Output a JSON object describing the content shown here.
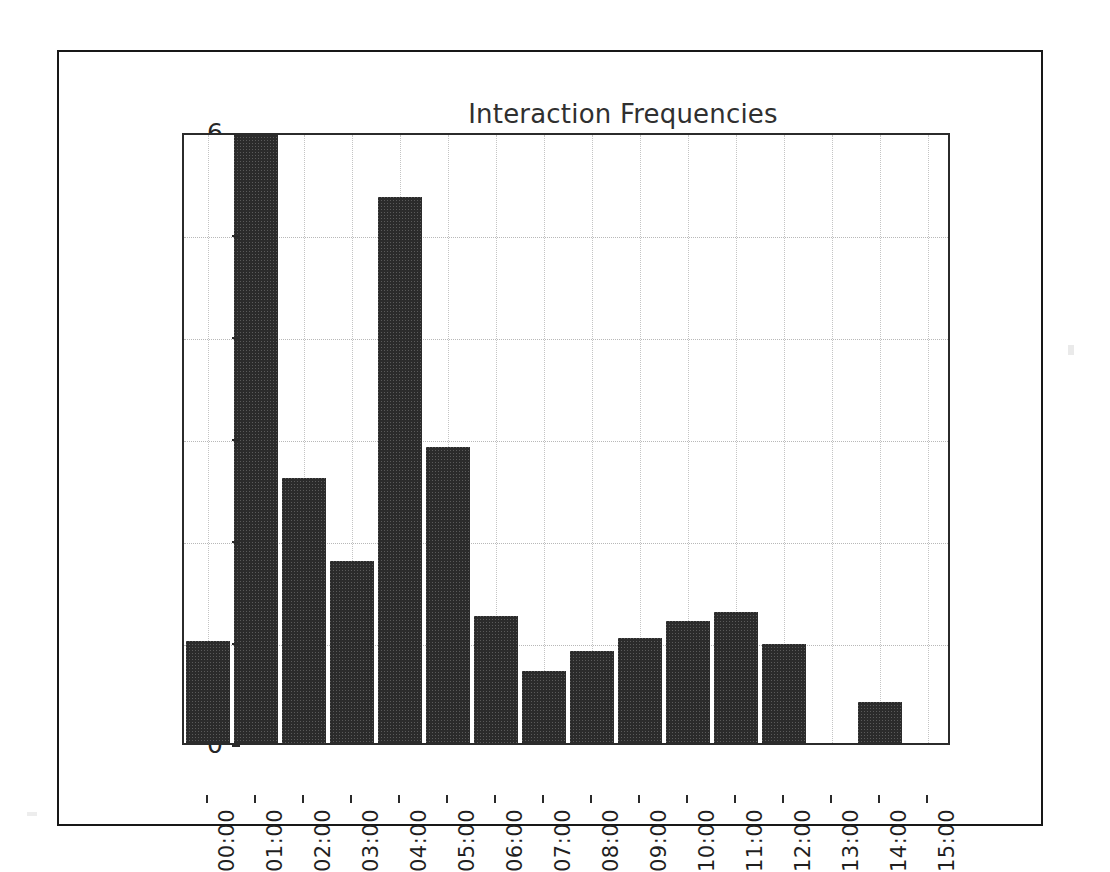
{
  "figure": {
    "background_color": "#ffffff",
    "border_color": "#181818",
    "bar_color": "#2b2b2b",
    "grid_color": "#bdbdbd",
    "axis_color": "#2b2b2b"
  },
  "chart_data": {
    "type": "bar",
    "title": "Interaction Frequencies",
    "xlabel": "",
    "ylabel": "",
    "categories": [
      "00:00",
      "01:00",
      "02:00",
      "03:00",
      "04:00",
      "05:00",
      "06:00",
      "07:00",
      "08:00",
      "09:00",
      "10:00",
      "11:00",
      "12:00",
      "13:00",
      "14:00",
      "15:00"
    ],
    "values": [
      1.0,
      6.0,
      2.6,
      1.78,
      5.35,
      2.9,
      1.25,
      0.71,
      0.9,
      1.03,
      1.2,
      1.28,
      0.97,
      0,
      0.4,
      0
    ],
    "ylim": [
      0,
      6
    ],
    "yticks": [
      0,
      1,
      2,
      3,
      4,
      5,
      6
    ],
    "ytick_labels": [
      "0",
      "1",
      "2",
      "3",
      "4",
      "5",
      "6"
    ],
    "grid": true,
    "grid_style": "dotted",
    "legend": false,
    "xtick_rotation": 90
  }
}
